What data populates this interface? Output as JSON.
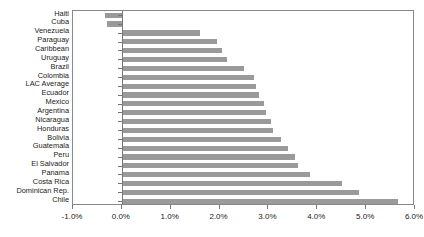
{
  "chart_data": {
    "type": "bar",
    "orientation": "horizontal",
    "title": "",
    "subtitle": "",
    "xlabel": "",
    "ylabel": "",
    "xlim": [
      -1.0,
      6.0
    ],
    "xticks": [
      -1.0,
      0.0,
      1.0,
      2.0,
      3.0,
      4.0,
      5.0,
      6.0
    ],
    "xtick_labels": [
      "-1.0%",
      "0.0%",
      "1.0%",
      "2.0%",
      "3.0%",
      "4.0%",
      "5.0%",
      "6.0%"
    ],
    "grid": false,
    "legend": false,
    "bar_color": "#9a9a9a",
    "axis_color": "#888888",
    "categories": [
      "Haiti",
      "Cuba",
      "Venezuela",
      "Paraguay",
      "Caribbean",
      "Uruguay",
      "Brazil",
      "Colombia",
      "LAC Average",
      "Ecuador",
      "Mexico",
      "Argentina",
      "Nicaragua",
      "Honduras",
      "Bolivia",
      "Guatemala",
      "Peru",
      "El Salvador",
      "Panama",
      "Costa Rica",
      "Dominican Rep.",
      "Chile"
    ],
    "values": [
      -0.35,
      -0.3,
      1.6,
      1.95,
      2.05,
      2.15,
      2.5,
      2.7,
      2.75,
      2.8,
      2.9,
      2.95,
      3.05,
      3.1,
      3.25,
      3.4,
      3.55,
      3.6,
      3.85,
      4.5,
      4.85,
      5.65
    ],
    "units": "percent"
  }
}
